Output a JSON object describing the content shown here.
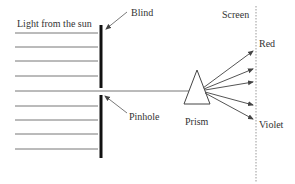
{
  "diagram": {
    "labels": {
      "light_source": "Light from the sun",
      "blind": "Blind",
      "pinhole": "Pinhole",
      "prism": "Prism",
      "screen": "Screen",
      "red": "Red",
      "violet": "Violet"
    },
    "incoming_ray_count": 9,
    "dispersed_ray_count": 5,
    "colors": {
      "line": "#777777",
      "blind": "#111111",
      "text": "#333333",
      "screen": "#999999"
    }
  }
}
